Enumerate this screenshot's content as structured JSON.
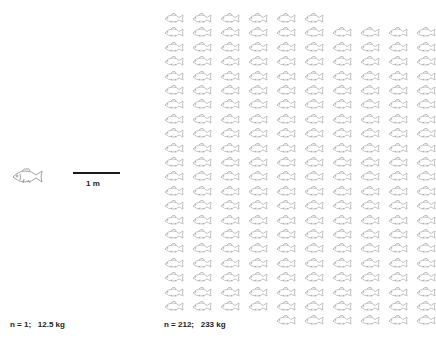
{
  "single": {
    "icon": "fish-icon",
    "caption": "n = 1;   12.5 kg"
  },
  "scale": {
    "label": "1 m"
  },
  "group": {
    "icon": "fish-icon",
    "caption": "n = 212;   233 kg",
    "count": 212,
    "columns": 10,
    "rows": [
      {
        "start_col": 0,
        "count": 6
      },
      {
        "start_col": 0,
        "count": 10
      },
      {
        "start_col": 0,
        "count": 10
      },
      {
        "start_col": 0,
        "count": 10
      },
      {
        "start_col": 0,
        "count": 10
      },
      {
        "start_col": 0,
        "count": 10
      },
      {
        "start_col": 0,
        "count": 10
      },
      {
        "start_col": 0,
        "count": 10
      },
      {
        "start_col": 0,
        "count": 10
      },
      {
        "start_col": 0,
        "count": 10
      },
      {
        "start_col": 0,
        "count": 10
      },
      {
        "start_col": 0,
        "count": 10
      },
      {
        "start_col": 0,
        "count": 10
      },
      {
        "start_col": 0,
        "count": 10
      },
      {
        "start_col": 0,
        "count": 10
      },
      {
        "start_col": 0,
        "count": 10
      },
      {
        "start_col": 0,
        "count": 10
      },
      {
        "start_col": 0,
        "count": 10
      },
      {
        "start_col": 0,
        "count": 10
      },
      {
        "start_col": 0,
        "count": 10
      },
      {
        "start_col": 0,
        "count": 10
      },
      {
        "start_col": 4,
        "count": 6
      }
    ]
  },
  "colors": {
    "fish_stroke": "#9a9a9a",
    "text": "#222222",
    "scale_bar": "#1a1a1a"
  }
}
